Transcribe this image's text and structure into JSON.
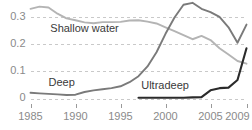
{
  "chart_data": {
    "type": "line",
    "title": "",
    "subtitle": "",
    "xlabel": "",
    "ylabel": "",
    "xlim": [
      1985,
      2009
    ],
    "ylim": [
      0,
      0.355
    ],
    "grid": true,
    "legend": "inline-annotations",
    "y_ticks": [
      "0",
      "0.1",
      "0.2",
      "0.3"
    ],
    "y_tick_values": [
      0,
      0.1,
      0.2,
      0.3
    ],
    "x_ticks": [
      "1985",
      "1990",
      "1995",
      "2000",
      "2005",
      "2009"
    ],
    "x_tick_values": [
      1985,
      1990,
      1995,
      2000,
      2005,
      2009
    ],
    "x": [
      1985,
      1986,
      1987,
      1988,
      1989,
      1990,
      1991,
      1992,
      1993,
      1994,
      1995,
      1996,
      1997,
      1998,
      1999,
      2000,
      2001,
      2002,
      2003,
      2004,
      2005,
      2006,
      2007,
      2008,
      2009
    ],
    "series": [
      {
        "name": "Shallow water",
        "color": "#b4b4b4",
        "label_x": 1987.2,
        "label_y": 0.243,
        "values": [
          0.33,
          0.338,
          0.335,
          0.312,
          0.295,
          0.288,
          0.28,
          0.277,
          0.281,
          0.281,
          0.282,
          0.287,
          0.288,
          0.283,
          0.276,
          0.262,
          0.248,
          0.233,
          0.218,
          0.23,
          0.215,
          0.185,
          0.162,
          0.138,
          0.128
        ]
      },
      {
        "name": "Deep",
        "color": "#7a7a7a",
        "label_x": 1987.0,
        "label_y": 0.047,
        "values": [
          0.021,
          0.019,
          0.017,
          0.015,
          0.013,
          0.014,
          0.024,
          0.03,
          0.034,
          0.038,
          0.045,
          0.06,
          0.082,
          0.118,
          0.17,
          0.238,
          0.298,
          0.345,
          0.352,
          0.33,
          0.318,
          0.3,
          0.262,
          0.205,
          0.272
        ]
      },
      {
        "name": "Ultradeep",
        "color": "#2b2b2b",
        "label_x": 1997.3,
        "label_y": 0.035,
        "start_year": 1997,
        "values": [
          null,
          null,
          null,
          null,
          null,
          null,
          null,
          null,
          null,
          null,
          null,
          null,
          0.003,
          0.003,
          0.003,
          0.003,
          0.003,
          0.003,
          0.004,
          0.005,
          0.03,
          0.038,
          0.04,
          0.068,
          0.185
        ]
      }
    ]
  },
  "axis": {
    "y_label_color": "#8a8a8a",
    "x_label_color": "#8a8a8a",
    "grid_color": "#c9c9c9"
  }
}
